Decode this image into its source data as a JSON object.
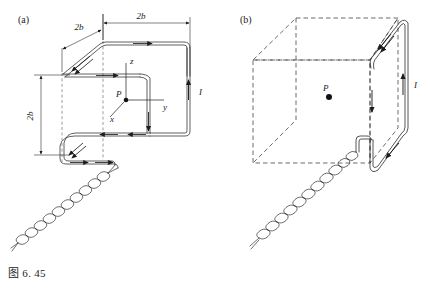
{
  "figure": {
    "caption": "图 6. 45",
    "panels": [
      {
        "tag": "(a)",
        "name": "panel-a"
      },
      {
        "tag": "(b)",
        "name": "panel-b"
      }
    ]
  },
  "panel_a": {
    "tag": "(a)",
    "dimensions": [
      {
        "label": "2b",
        "name": "dimension-top-right",
        "orientation": "horizontal"
      },
      {
        "label": "2b",
        "name": "dimension-top-left",
        "orientation": "diagonal"
      },
      {
        "label": "2b",
        "name": "dimension-left-vertical",
        "orientation": "vertical"
      }
    ],
    "axes": [
      {
        "label": "z",
        "name": "axis-z"
      },
      {
        "label": "y",
        "name": "axis-y"
      },
      {
        "label": "x",
        "name": "axis-x"
      }
    ],
    "point_label": "P",
    "current_label": "I"
  },
  "panel_b": {
    "tag": "(b)",
    "point_label": "P",
    "current_label": "I"
  },
  "colors": {
    "ink": "#1c1c1c",
    "wire": "#2b2b2b",
    "dashed": "#3a3a3a",
    "background": "#ffffff"
  }
}
